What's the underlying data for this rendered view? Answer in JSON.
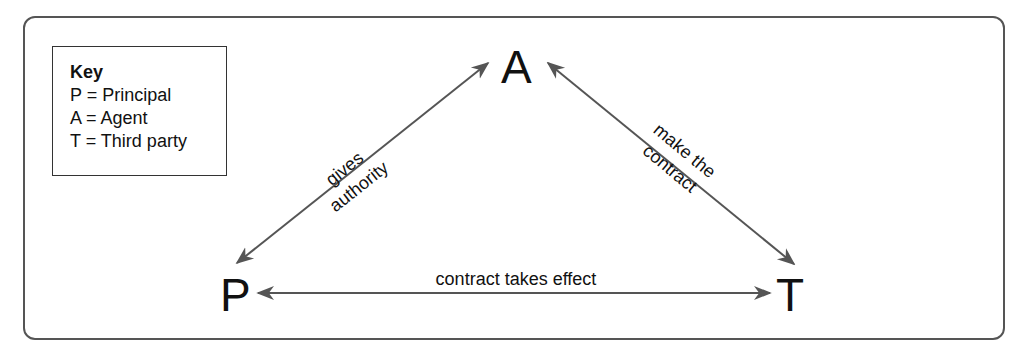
{
  "key": {
    "title": "Key",
    "entries": [
      {
        "symbol": "P",
        "meaning": "Principal",
        "text": "P = Principal"
      },
      {
        "symbol": "A",
        "meaning": "Agent",
        "text": "A = Agent"
      },
      {
        "symbol": "T",
        "meaning": "Third party",
        "text": "T = Third party"
      }
    ]
  },
  "nodes": {
    "agent": "A",
    "principal": "P",
    "third_party": "T"
  },
  "edges": {
    "principal_agent": {
      "line1": "gives",
      "line2": "authority"
    },
    "agent_third_party": {
      "line1": "make the",
      "line2": "contract"
    },
    "principal_third_party": {
      "label": "contract takes effect"
    }
  },
  "colors": {
    "line": "#555555",
    "text": "#111111",
    "frame": "#555555"
  }
}
